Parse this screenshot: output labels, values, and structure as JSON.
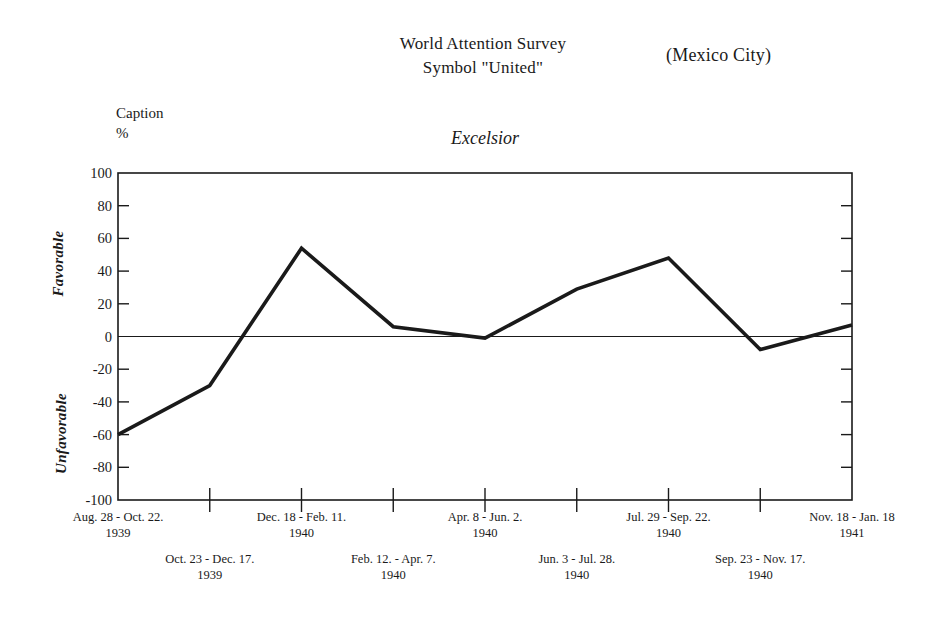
{
  "header": {
    "survey_title_line1": "World Attention Survey",
    "survey_title_line2": "Symbol \"United\"",
    "city": "(Mexico City)"
  },
  "caption": {
    "label": "Caption",
    "unit": "%"
  },
  "chart_data": {
    "type": "line",
    "title": "Excelsior",
    "xlabel": "",
    "ylabel": "%",
    "ylim": [
      -100,
      100
    ],
    "ytick_values": [
      100,
      80,
      60,
      40,
      20,
      0,
      -20,
      -40,
      -60,
      -80,
      -100
    ],
    "ytick_labels": [
      "100",
      "80",
      "60",
      "40",
      "20",
      "0",
      "-20",
      "-40",
      "-60",
      "-80",
      "-100"
    ],
    "y_axis_upper_title": "Favorable",
    "y_axis_lower_title": "Unfavorable",
    "grid": false,
    "legend": "none",
    "zero_line": true,
    "categories": [
      "Aug. 28 - Oct. 22.\n1939",
      "Oct. 23 - Dec. 17.\n1939",
      "Dec. 18 - Feb. 11.\n1940",
      "Feb. 12. - Apr. 7.\n1940",
      "Apr. 8 - Jun. 2.\n1940",
      "Jun. 3 - Jul. 28.\n1940",
      "Jul. 29 - Sep. 22.\n1940",
      "Sep. 23 - Nov. 17.\n1940",
      "Nov. 18 - Jan. 18\n1941"
    ],
    "xtick_labels": [
      {
        "period": "Aug. 28 - Oct. 22.",
        "year": "1939"
      },
      {
        "period": "Oct. 23 - Dec. 17.",
        "year": "1939"
      },
      {
        "period": "Dec. 18 - Feb. 11.",
        "year": "1940"
      },
      {
        "period": "Feb. 12. - Apr. 7.",
        "year": "1940"
      },
      {
        "period": "Apr. 8 - Jun. 2.",
        "year": "1940"
      },
      {
        "period": "Jun. 3 - Jul. 28.",
        "year": "1940"
      },
      {
        "period": "Jul. 29 - Sep. 22.",
        "year": "1940"
      },
      {
        "period": "Sep. 23 - Nov. 17.",
        "year": "1940"
      },
      {
        "period": "Nov. 18 - Jan. 18",
        "year": "1941"
      }
    ],
    "values": [
      -60,
      -30,
      54,
      6,
      -1,
      29,
      48,
      -8,
      7
    ],
    "line_color": "#1a1a1a",
    "axis_color": "#1a1a1a"
  }
}
